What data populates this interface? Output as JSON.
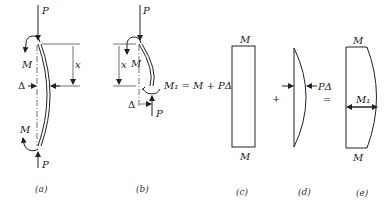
{
  "figure": {
    "panels": [
      {
        "id": "a",
        "caption": "(a)",
        "labels": {
          "top_force": "P",
          "bottom_force": "P",
          "top_moment": "M",
          "bottom_moment": "M",
          "deflection": "Δ",
          "distance": "x"
        }
      },
      {
        "id": "b",
        "caption": "(b)",
        "labels": {
          "top_force": "P",
          "bottom_force": "P",
          "top_moment": "M",
          "distance": "x",
          "deflection": "Δ",
          "internal_moment_equation": "M₁ = M + PΔ"
        }
      },
      {
        "id": "c",
        "caption": "(c)",
        "labels": {
          "top": "M",
          "bottom": "M"
        }
      },
      {
        "id": "d",
        "caption": "(d)",
        "labels": {
          "max": "PΔ"
        }
      },
      {
        "id": "e",
        "caption": "(e)",
        "labels": {
          "top": "M",
          "bottom": "M",
          "max": "M₁"
        }
      }
    ],
    "operators": {
      "plus": "+",
      "equals": "="
    }
  }
}
